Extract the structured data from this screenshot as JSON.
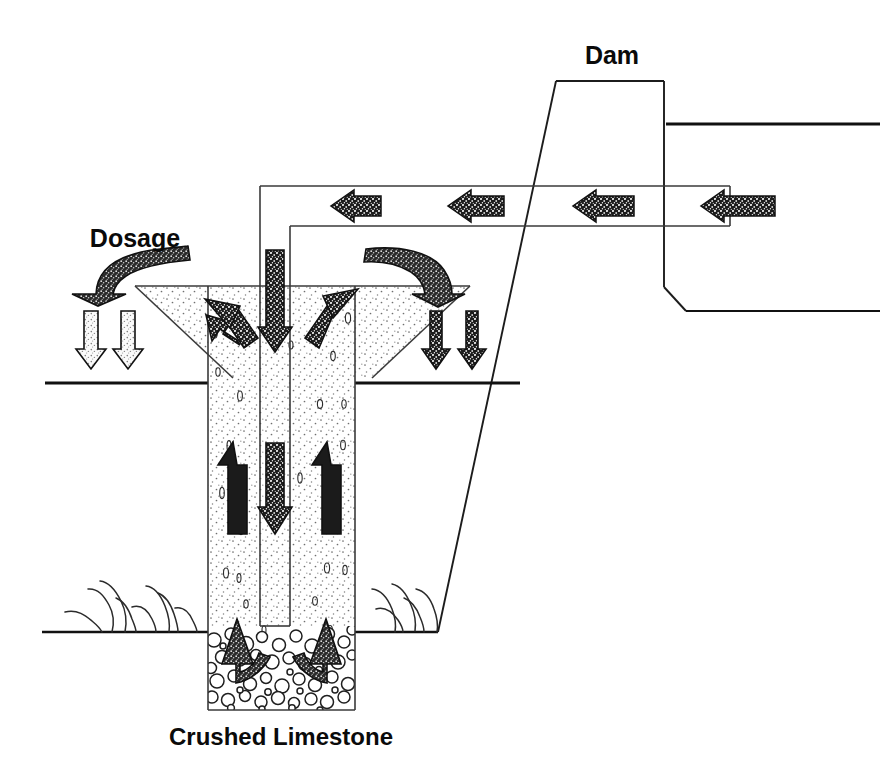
{
  "diagram": {
    "title_visible": false,
    "labels": {
      "dosage": "Dosage",
      "dam": "Dam",
      "crushed_limestone": "Crushed Limestone"
    },
    "colors": {
      "line": "#111111",
      "thin_line": "#3a3a3a",
      "arrow_dark_fill": "#1a1a1a",
      "arrow_light_fill": "#f2f2f2",
      "arrow_stroke": "#111111",
      "sand_fill": "#fdfdfd",
      "rock_fill": "#ffffff",
      "background": "#ffffff"
    },
    "elements": {
      "dam_label_x": 612,
      "dam_label_y": 64,
      "dosage_label_x": 135,
      "dosage_label_y": 247,
      "limestone_label_x": 281,
      "limestone_label_y": 745
    },
    "flow_arrows": {
      "horizontal_channel_arrows": {
        "count": 4,
        "direction": "left",
        "style": "dark-textured",
        "y": 205
      },
      "surface_down_arrows_left": {
        "count": 2,
        "direction": "down",
        "style": "light-textured"
      },
      "surface_down_arrows_right": {
        "count": 2,
        "direction": "down",
        "style": "dark-textured"
      },
      "central_pipe_arrow": {
        "count": 1,
        "direction": "down",
        "style": "dark-textured"
      },
      "funnel_diagonal_arrows": {
        "count": 2,
        "direction": "up-inward",
        "style": "dark-textured"
      },
      "shaft_up_arrows": {
        "count": 2,
        "direction": "up",
        "style": "dark-solid"
      },
      "limestone_curved_arrows": {
        "count": 2,
        "direction": "up-outward",
        "style": "dark-curved"
      },
      "dosage_curved_arrows": {
        "count": 2,
        "direction": "down-inward",
        "style": "dark-curved-textured"
      }
    }
  }
}
